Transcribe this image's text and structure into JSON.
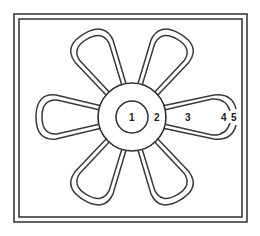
{
  "diagram": {
    "colors": {
      "line": "#3a3a3a",
      "background": "#ffffff",
      "text": "#222222"
    },
    "center": {
      "x": 132,
      "y": 117,
      "hub_radius": 34,
      "core_radius": 16
    },
    "petal_count": 6,
    "labels": [
      {
        "id": "1",
        "text": "1",
        "x": 129,
        "y": 121,
        "region": "inner core circle"
      },
      {
        "id": "2",
        "text": "2",
        "x": 154,
        "y": 121,
        "region": "hub ring"
      },
      {
        "id": "3",
        "text": "3",
        "x": 186,
        "y": 121,
        "region": "petal interior"
      },
      {
        "id": "4",
        "text": "4",
        "x": 221,
        "y": 121,
        "region": "inner petal line"
      },
      {
        "id": "5",
        "text": "5",
        "x": 232,
        "y": 121,
        "region": "outer petal line"
      }
    ]
  }
}
